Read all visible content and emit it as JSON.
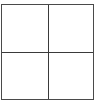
{
  "grid": {
    "rows": 2,
    "columns": 2,
    "cells": [
      {
        "row": 0,
        "col": 0,
        "content": ""
      },
      {
        "row": 0,
        "col": 1,
        "content": ""
      },
      {
        "row": 1,
        "col": 0,
        "content": ""
      },
      {
        "row": 1,
        "col": 1,
        "content": ""
      }
    ],
    "line_color": "#3a3a3a",
    "background": "#ffffff"
  }
}
